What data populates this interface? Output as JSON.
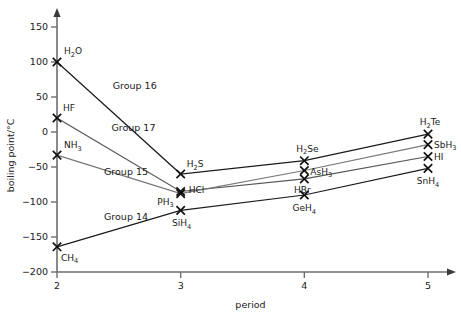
{
  "chart_data": {
    "type": "line",
    "title": "",
    "xlabel": "period",
    "ylabel": "boiling point/°C",
    "xlim": [
      2,
      5
    ],
    "ylim": [
      -200,
      150
    ],
    "grid": false,
    "legend_position": "inline-annotations",
    "x": [
      2,
      3,
      4,
      5
    ],
    "xticklabels": [
      "2",
      "3",
      "4",
      "5"
    ],
    "yticks": [
      -200,
      -150,
      -100,
      -50,
      0,
      50,
      100,
      150
    ],
    "yticklabels": [
      "−200",
      "−150",
      "−100",
      "−50",
      "0",
      "50",
      "100",
      "150"
    ],
    "series": [
      {
        "name": "Group 16",
        "color": "#1a1a1a",
        "values": [
          100,
          -60,
          -41,
          -3
        ],
        "point_labels": [
          "H2O",
          "H2S",
          "H2Se",
          "H2Te"
        ]
      },
      {
        "name": "Group 17",
        "color": "#555555",
        "values": [
          20,
          -85,
          -67,
          -35
        ],
        "point_labels": [
          "HF",
          "HCl",
          "HBr",
          "HI"
        ]
      },
      {
        "name": "Group 15",
        "color": "#777777",
        "values": [
          -33,
          -88,
          -55,
          -18
        ],
        "point_labels": [
          "NH3",
          "PH3",
          "AsH3",
          "SbH3"
        ]
      },
      {
        "name": "Group 14",
        "color": "#1a1a1a",
        "values": [
          -164,
          -112,
          -90,
          -52
        ],
        "point_labels": [
          "CH4",
          "SiH4",
          "GeH4",
          "SnH4"
        ]
      }
    ],
    "annotations": [
      {
        "text": "Group 16",
        "x": 2.45,
        "y": 62
      },
      {
        "text": "Group 17",
        "x": 2.44,
        "y": 2
      },
      {
        "text": "Group 15",
        "x": 2.38,
        "y": -62
      },
      {
        "text": "Group 14",
        "x": 2.38,
        "y": -125
      }
    ],
    "point_label_text": {
      "H2O": {
        "base": "H",
        "sub": "2",
        "tail": "O"
      },
      "H2S": {
        "base": "H",
        "sub": "2",
        "tail": "S"
      },
      "H2Se": {
        "base": "H",
        "sub": "2",
        "tail": "Se"
      },
      "H2Te": {
        "base": "H",
        "sub": "2",
        "tail": "Te"
      },
      "HF": {
        "base": "HF",
        "sub": "",
        "tail": ""
      },
      "HCl": {
        "base": "HCl",
        "sub": "",
        "tail": ""
      },
      "HBr": {
        "base": "HBr",
        "sub": "",
        "tail": ""
      },
      "HI": {
        "base": "HI",
        "sub": "",
        "tail": ""
      },
      "NH3": {
        "base": "NH",
        "sub": "3",
        "tail": ""
      },
      "PH3": {
        "base": "PH",
        "sub": "3",
        "tail": ""
      },
      "AsH3": {
        "base": "AsH",
        "sub": "3",
        "tail": ""
      },
      "SbH3": {
        "base": "SbH",
        "sub": "3",
        "tail": ""
      },
      "CH4": {
        "base": "CH",
        "sub": "4",
        "tail": ""
      },
      "SiH4": {
        "base": "SiH",
        "sub": "4",
        "tail": ""
      },
      "GeH4": {
        "base": "GeH",
        "sub": "4",
        "tail": ""
      },
      "SnH4": {
        "base": "SnH",
        "sub": "4",
        "tail": ""
      }
    }
  },
  "axes": {
    "x_title": "period",
    "y_title_base": "boiling point/",
    "y_title_unit": "°C"
  },
  "colors": {
    "axis": "#6e6e6e",
    "text": "#1a1a1a",
    "group16": "#1a1a1a",
    "group17": "#555555",
    "group15": "#777777",
    "group14": "#1a1a1a"
  }
}
